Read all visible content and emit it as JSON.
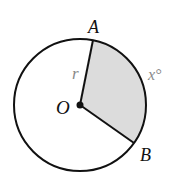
{
  "diagram": {
    "type": "circle-sector",
    "center_label": "O",
    "point_a_label": "A",
    "point_b_label": "B",
    "radius_label": "r",
    "arc_label": "x°",
    "colors": {
      "stroke": "#111111",
      "sector_fill": "#dcdcdc",
      "arc_label_color": "#8a8a8a",
      "radius_label_color": "#8a8a8a"
    }
  }
}
